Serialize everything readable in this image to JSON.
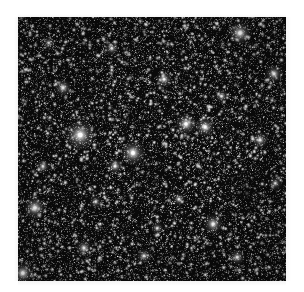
{
  "figure": {
    "kind": "astronomical-star-field-image",
    "caption": "",
    "panel": {
      "x": 18,
      "y": 17,
      "width": 268,
      "height": 264
    },
    "colors": {
      "page_background": "#ffffff",
      "sky_background": "#0a0a0a",
      "star_core": "#ffffff",
      "star_mid": "#b9b9b9",
      "star_faint": "#6e6e6e"
    },
    "render": {
      "seed": 20240517,
      "faint_star_count": 9000,
      "mid_star_count": 1700,
      "background_noise_count": 14000,
      "vignette_strength": 0.22
    },
    "bright_stars": [
      {
        "name": "star-A",
        "x": 0.232,
        "y": 0.447,
        "radius": 7.5,
        "intensity": 1.0
      },
      {
        "name": "star-B",
        "x": 0.429,
        "y": 0.515,
        "radius": 6.2,
        "intensity": 0.96
      },
      {
        "name": "star-C",
        "x": 0.828,
        "y": 0.061,
        "radius": 5.8,
        "intensity": 0.94
      },
      {
        "name": "star-D",
        "x": 0.063,
        "y": 0.723,
        "radius": 5.6,
        "intensity": 0.92
      },
      {
        "name": "star-E",
        "x": 0.627,
        "y": 0.405,
        "radius": 5.4,
        "intensity": 0.9
      },
      {
        "name": "star-F",
        "x": 0.698,
        "y": 0.417,
        "radius": 5.0,
        "intensity": 0.88
      },
      {
        "name": "star-G",
        "x": 0.018,
        "y": 0.97,
        "radius": 5.4,
        "intensity": 0.95
      },
      {
        "name": "star-H",
        "x": 0.728,
        "y": 0.784,
        "radius": 5.0,
        "intensity": 0.87
      },
      {
        "name": "star-I",
        "x": 0.955,
        "y": 0.215,
        "radius": 4.6,
        "intensity": 0.84
      },
      {
        "name": "star-J",
        "x": 0.168,
        "y": 0.268,
        "radius": 4.4,
        "intensity": 0.8
      },
      {
        "name": "star-K",
        "x": 0.545,
        "y": 0.236,
        "radius": 4.2,
        "intensity": 0.78
      },
      {
        "name": "star-L",
        "x": 0.362,
        "y": 0.565,
        "radius": 4.0,
        "intensity": 0.76
      },
      {
        "name": "star-M",
        "x": 0.903,
        "y": 0.466,
        "radius": 4.2,
        "intensity": 0.78
      },
      {
        "name": "star-N",
        "x": 0.246,
        "y": 0.875,
        "radius": 4.2,
        "intensity": 0.8
      },
      {
        "name": "star-O",
        "x": 0.47,
        "y": 0.905,
        "radius": 3.8,
        "intensity": 0.74
      },
      {
        "name": "star-P",
        "x": 0.818,
        "y": 0.91,
        "radius": 4.0,
        "intensity": 0.76
      },
      {
        "name": "star-Q",
        "x": 0.093,
        "y": 0.566,
        "radius": 3.6,
        "intensity": 0.72
      },
      {
        "name": "star-R",
        "x": 0.35,
        "y": 0.119,
        "radius": 3.6,
        "intensity": 0.72
      },
      {
        "name": "star-S",
        "x": 0.6,
        "y": 0.69,
        "radius": 3.4,
        "intensity": 0.7
      },
      {
        "name": "star-T",
        "x": 0.96,
        "y": 0.63,
        "radius": 3.4,
        "intensity": 0.7
      },
      {
        "name": "star-U",
        "x": 0.115,
        "y": 0.098,
        "radius": 3.2,
        "intensity": 0.68
      },
      {
        "name": "star-V",
        "x": 0.76,
        "y": 0.3,
        "radius": 3.4,
        "intensity": 0.7
      },
      {
        "name": "star-W",
        "x": 0.29,
        "y": 0.7,
        "radius": 3.2,
        "intensity": 0.66
      },
      {
        "name": "star-X",
        "x": 0.52,
        "y": 0.8,
        "radius": 3.2,
        "intensity": 0.66
      }
    ],
    "dark_patches": [
      {
        "name": "dust-lane-1",
        "x": 0.855,
        "y": 0.66,
        "radius": 0.085,
        "opacity": 0.42
      },
      {
        "name": "dust-lane-2",
        "x": 0.47,
        "y": 0.56,
        "radius": 0.07,
        "opacity": 0.26
      },
      {
        "name": "dust-lane-3",
        "x": 0.23,
        "y": 0.61,
        "radius": 0.06,
        "opacity": 0.22
      }
    ]
  }
}
